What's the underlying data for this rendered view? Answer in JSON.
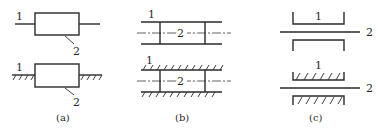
{
  "figure": {
    "panels": [
      {
        "caption": "(a)",
        "top": {
          "label_1": "1",
          "label_2": "2"
        },
        "bottom": {
          "label_1": "1",
          "label_2": "2"
        }
      },
      {
        "caption": "(b)",
        "top": {
          "label_1": "1",
          "label_2": "2"
        },
        "bottom": {
          "label_1": "1",
          "label_2": "2"
        }
      },
      {
        "caption": "(c)",
        "top": {
          "label_1": "1",
          "label_2": "2"
        },
        "bottom": {
          "label_1": "1",
          "label_2": "2"
        }
      }
    ],
    "colors": {
      "ink": "#2a2a2a",
      "background": "#ffffff"
    }
  }
}
